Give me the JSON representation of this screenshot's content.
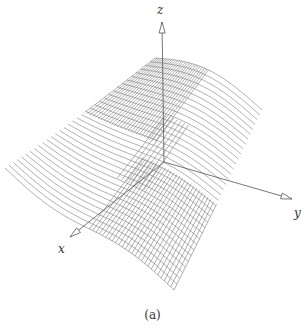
{
  "figure": {
    "caption": "(a)",
    "line_color": "#6e6e6e",
    "axis_color": "#555555"
  },
  "axes": {
    "origin": [
      164,
      162
    ],
    "z": {
      "label": "z",
      "tip": [
        162,
        22
      ],
      "label_pos": [
        157,
        4
      ]
    },
    "y": {
      "label": "y",
      "tip": [
        292,
        199
      ],
      "label_pos": [
        294,
        207
      ]
    },
    "x": {
      "label": "x",
      "tip": [
        70,
        237
      ],
      "label_pos": [
        58,
        243
      ]
    }
  },
  "surface": {
    "corners": {
      "back": [
        155,
        58
      ],
      "right": [
        262,
        110
      ],
      "front": [
        174,
        290
      ],
      "left": [
        5,
        168
      ]
    },
    "u_lines": 34,
    "v_lines_dense_region": 26
  }
}
